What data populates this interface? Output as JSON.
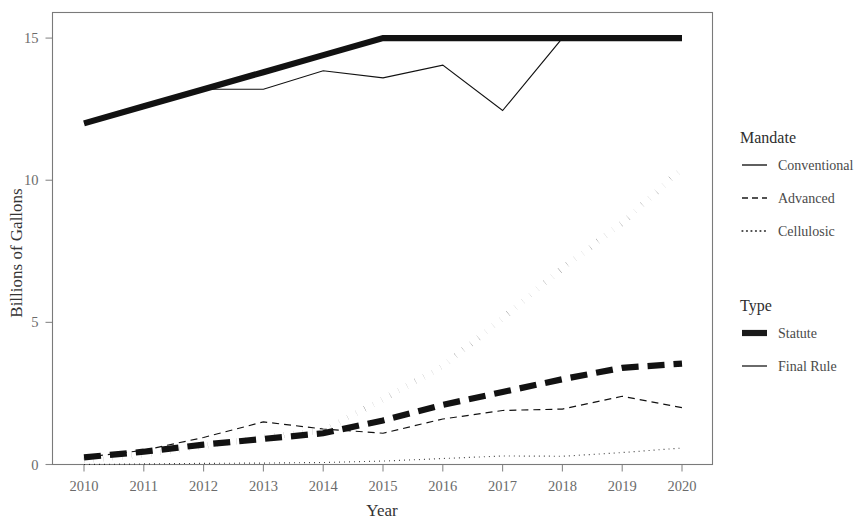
{
  "chart_data": {
    "type": "line",
    "title": "",
    "xlabel": "Year",
    "ylabel": "Billions of Gallons",
    "x": [
      2010,
      2011,
      2012,
      2013,
      2014,
      2015,
      2016,
      2017,
      2018,
      2019,
      2020
    ],
    "xticklabels": [
      "2010",
      "2011",
      "2012",
      "2013",
      "2014",
      "2015",
      "2016",
      "2017",
      "2018",
      "2019",
      "2020"
    ],
    "yticklabels": [
      "0",
      "5",
      "10",
      "15"
    ],
    "yticks": [
      0,
      5,
      10,
      15
    ],
    "xlim": [
      2010,
      2020
    ],
    "ylim": [
      0,
      15.9
    ],
    "grid": false,
    "legend_position": "right",
    "series": [
      {
        "name": "Conventional Statute",
        "mandate": "Conventional",
        "type": "Statute",
        "linestyle": "solid",
        "linewidth": "thick",
        "values": [
          12.0,
          12.6,
          13.2,
          13.8,
          14.4,
          15.0,
          15.0,
          15.0,
          15.0,
          15.0,
          15.0
        ]
      },
      {
        "name": "Conventional Final Rule",
        "mandate": "Conventional",
        "type": "Final Rule",
        "linestyle": "solid",
        "linewidth": "thin",
        "values": [
          12.0,
          12.6,
          13.2,
          13.2,
          13.8,
          13.6,
          14.05,
          12.45,
          15.0,
          15.0,
          15.0
        ]
      },
      {
        "name": "Advanced Statute",
        "mandate": "Advanced",
        "type": "Statute",
        "linestyle": "dashed",
        "linewidth": "thick",
        "values": [
          0.95,
          1.35,
          2.0,
          2.75,
          3.75,
          5.5,
          7.25,
          9.0,
          11.0,
          13.0,
          15.0
        ]
      },
      {
        "name": "Advanced Final Rule",
        "mandate": "Advanced",
        "type": "Final Rule",
        "linestyle": "dashed",
        "linewidth": "thin",
        "values": [
          0.95,
          1.35,
          2.0,
          2.75,
          2.67,
          2.88,
          3.61,
          4.28,
          4.29,
          4.92,
          4.63
        ]
      },
      {
        "name": "Cellulosic Statute",
        "mandate": "Cellulosic",
        "type": "Statute",
        "linestyle": "dotted",
        "linewidth": "thick",
        "values": [
          0.1,
          0.25,
          0.5,
          1.0,
          1.75,
          3.0,
          4.25,
          5.5,
          7.0,
          8.5,
          10.5
        ]
      },
      {
        "name": "Cellulosic Final Rule",
        "mandate": "Cellulosic",
        "type": "Final Rule",
        "linestyle": "dotted",
        "linewidth": "thin",
        "values": [
          0.0065,
          0.006,
          0.0105,
          0.006,
          0.033,
          0.123,
          0.23,
          0.311,
          0.288,
          0.418,
          0.59
        ]
      }
    ],
    "plot_series": [
      {
        "key": "cellulosic_statute",
        "values": [
          0.15,
          0.35,
          0.65,
          0.95,
          1.2,
          2.3,
          3.45,
          5.15,
          6.9,
          8.5,
          10.4
        ],
        "linestyle": "dotted",
        "linewidth": "thick"
      },
      {
        "key": "advanced_statute",
        "values": [
          0.25,
          0.45,
          0.7,
          0.9,
          1.1,
          1.55,
          2.1,
          2.55,
          3.0,
          3.4,
          3.55
        ],
        "linestyle": "dashed",
        "linewidth": "thick"
      },
      {
        "key": "conventional_statute",
        "values": [
          12.0,
          12.6,
          13.2,
          13.8,
          14.4,
          15.0,
          15.0,
          15.0,
          15.0,
          15.0,
          15.0
        ],
        "linestyle": "solid",
        "linewidth": "thick"
      },
      {
        "key": "conventional_final_rule",
        "values": [
          12.0,
          12.6,
          13.2,
          13.2,
          13.85,
          13.6,
          14.05,
          12.45,
          15.0,
          15.0,
          15.0
        ],
        "linestyle": "solid",
        "linewidth": "thin"
      },
      {
        "key": "advanced_final_rule",
        "values": [
          0.25,
          0.5,
          0.95,
          1.5,
          1.25,
          1.1,
          1.6,
          1.9,
          1.95,
          2.4,
          2.0
        ],
        "linestyle": "dashed",
        "linewidth": "thin"
      },
      {
        "key": "cellulosic_final_rule",
        "values": [
          0.0,
          0.02,
          0.04,
          0.05,
          0.07,
          0.12,
          0.21,
          0.3,
          0.29,
          0.42,
          0.58
        ],
        "linestyle": "dotted",
        "linewidth": "thin"
      }
    ]
  },
  "legends": [
    {
      "title": "Mandate",
      "items": [
        {
          "label": "Conventional",
          "key_style": "solid"
        },
        {
          "label": "Advanced",
          "key_style": "dashed"
        },
        {
          "label": "Cellulosic",
          "key_style": "dotted"
        }
      ]
    },
    {
      "title": "Type",
      "items": [
        {
          "label": "Statute",
          "key_style": "thick"
        },
        {
          "label": "Final Rule",
          "key_style": "thin"
        }
      ]
    }
  ],
  "style": {
    "ink": "#121212",
    "axis": "#7a7a7a",
    "text": "#3d3d3d",
    "background": "#ffffff"
  }
}
